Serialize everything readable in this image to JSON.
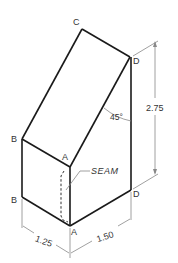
{
  "figure": {
    "vertex_labels": {
      "C": "C",
      "D_top": "D",
      "B_upper": "B",
      "A_top": "A",
      "B_lower": "B",
      "D_lower": "D",
      "A_bottom": "A"
    },
    "angle_label": "45°",
    "seam_label": "SEAM",
    "dimensions": {
      "height": "2.75",
      "left_width": "1.25",
      "right_width": "1.50"
    },
    "colors": {
      "edge": "#1a1a1a",
      "dimension": "#888888",
      "text": "#333333"
    }
  }
}
